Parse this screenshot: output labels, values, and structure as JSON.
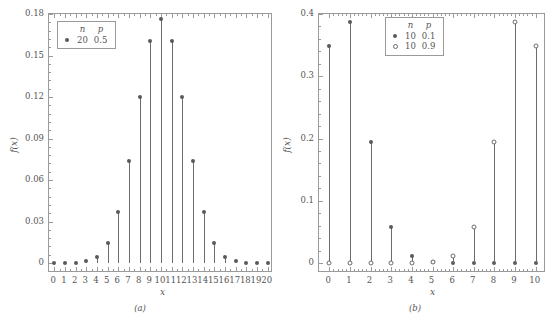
{
  "figure": {
    "panels": [
      {
        "id": "a",
        "caption": "(a)",
        "xlabel": "x",
        "ylabel": "f(x)",
        "legend": {
          "headers": [
            "n",
            "p"
          ],
          "rows": [
            {
              "marker": "filled",
              "n": "20",
              "p": "0.5"
            }
          ]
        },
        "chart_data": {
          "type": "scatter",
          "title": "",
          "xlabel": "x",
          "ylabel": "f(x)",
          "xlim": [
            -0.5,
            20.5
          ],
          "ylim": [
            0,
            0.18
          ],
          "xticks": [
            0,
            1,
            2,
            3,
            4,
            5,
            6,
            7,
            8,
            9,
            10,
            11,
            12,
            13,
            14,
            15,
            16,
            17,
            18,
            19,
            20
          ],
          "xticklabels": [
            "0",
            "1",
            "2",
            "3",
            "4",
            "5",
            "6",
            "7",
            "8",
            "9",
            "10",
            "11",
            "12",
            "13",
            "14",
            "15",
            "16",
            "17",
            "18",
            "19",
            "20"
          ],
          "yticks": [
            0,
            0.03,
            0.06,
            0.09,
            0.12,
            0.15,
            0.18
          ],
          "yticklabels": [
            "0",
            "0.03",
            "0.06",
            "0.09",
            "0.12",
            "0.15",
            "0.18"
          ],
          "grid": false,
          "legend_position": "upper-left-inside",
          "series": [
            {
              "name": "n=20, p=0.5",
              "marker": "filled",
              "n": 20,
              "p": 0.5,
              "x": [
                0,
                1,
                2,
                3,
                4,
                5,
                6,
                7,
                8,
                9,
                10,
                11,
                12,
                13,
                14,
                15,
                16,
                17,
                18,
                19,
                20
              ],
              "values": [
                1e-06,
                1.9e-05,
                0.000181,
                0.001087,
                0.004621,
                0.014786,
                0.036964,
                0.073929,
                0.120134,
                0.160179,
                0.176197,
                0.160179,
                0.120134,
                0.073929,
                0.036964,
                0.014786,
                0.004621,
                0.001087,
                0.000181,
                1.9e-05,
                1e-06
              ]
            }
          ]
        }
      },
      {
        "id": "b",
        "caption": "(b)",
        "xlabel": "x",
        "ylabel": "f(x)",
        "legend": {
          "headers": [
            "n",
            "p"
          ],
          "rows": [
            {
              "marker": "filled",
              "n": "10",
              "p": "0.1"
            },
            {
              "marker": "open",
              "n": "10",
              "p": "0.9"
            }
          ]
        },
        "chart_data": {
          "type": "scatter",
          "title": "",
          "xlabel": "x",
          "ylabel": "f(x)",
          "xlim": [
            -0.5,
            10.5
          ],
          "ylim": [
            0,
            0.4
          ],
          "xticks": [
            0,
            1,
            2,
            3,
            4,
            5,
            6,
            7,
            8,
            9,
            10
          ],
          "xticklabels": [
            "0",
            "1",
            "2",
            "3",
            "4",
            "5",
            "6",
            "7",
            "8",
            "9",
            "10"
          ],
          "yticks": [
            0,
            0.1,
            0.2,
            0.3,
            0.4
          ],
          "yticklabels": [
            "0",
            "0.1",
            "0.2",
            "0.3",
            "0.4"
          ],
          "grid": false,
          "legend_position": "upper-center-inside",
          "series": [
            {
              "name": "n=10, p=0.1",
              "marker": "filled",
              "n": 10,
              "p": 0.1,
              "x": [
                0,
                1,
                2,
                3,
                4,
                5,
                6,
                7,
                8,
                9,
                10
              ],
              "values": [
                0.348678,
                0.38742,
                0.19371,
                0.057396,
                0.01116,
                0.001488,
                0.000138,
                8.7e-06,
                3.6e-07,
                9e-09,
                1e-10
              ]
            },
            {
              "name": "n=10, p=0.9",
              "marker": "open",
              "n": 10,
              "p": 0.9,
              "x": [
                0,
                1,
                2,
                3,
                4,
                5,
                6,
                7,
                8,
                9,
                10
              ],
              "values": [
                1e-10,
                9e-09,
                3.6e-07,
                8.7e-06,
                0.000138,
                0.001488,
                0.01116,
                0.057396,
                0.19371,
                0.38742,
                0.348678
              ]
            }
          ]
        }
      }
    ],
    "colors": {
      "axis": "#9a9a9a",
      "marker": "#5a5a5a",
      "stem": "#6b6b6b",
      "text": "#555555",
      "background": "#ffffff"
    }
  }
}
